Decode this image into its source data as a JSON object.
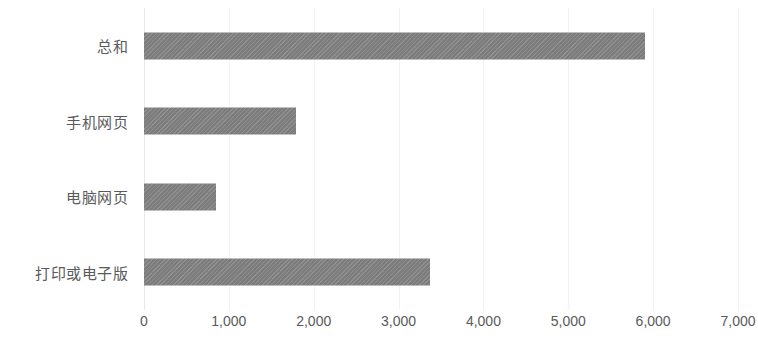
{
  "chart_data": {
    "type": "bar",
    "orientation": "horizontal",
    "title": "",
    "subtitle": "",
    "xlabel": "",
    "ylabel": "",
    "categories": [
      "总和",
      "手机网页",
      "电脑网页",
      "打印或电子版"
    ],
    "values": [
      5900,
      1790,
      850,
      3370
    ],
    "series": [
      {
        "name": "",
        "values": [
          5900,
          1790,
          850,
          3370
        ]
      }
    ],
    "xlim": [
      0,
      7000
    ],
    "xticks": [
      0,
      1000,
      2000,
      3000,
      4000,
      5000,
      6000,
      7000
    ],
    "xtick_labels": [
      "0",
      "1,000",
      "2,000",
      "3,000",
      "4,000",
      "5,000",
      "6,000",
      "7,000"
    ],
    "grid": true,
    "grid_axis": "x",
    "legend": false,
    "legend_position": "none",
    "annotations": [],
    "colors": {
      "bar": "#828282",
      "gridline": "#f2f2f2",
      "axis_text": "#5a5a5a",
      "background": "#ffffff"
    }
  },
  "axis": {
    "x_ticks": [
      {
        "value": 0,
        "label": "0"
      },
      {
        "value": 1000,
        "label": "1,000"
      },
      {
        "value": 2000,
        "label": "2,000"
      },
      {
        "value": 3000,
        "label": "3,000"
      },
      {
        "value": 4000,
        "label": "4,000"
      },
      {
        "value": 5000,
        "label": "5,000"
      },
      {
        "value": 6000,
        "label": "6,000"
      },
      {
        "value": 7000,
        "label": "7,000"
      }
    ]
  },
  "categories": [
    {
      "label": "总和",
      "value": 5900
    },
    {
      "label": "手机网页",
      "value": 1790
    },
    {
      "label": "电脑网页",
      "value": 850
    },
    {
      "label": "打印或电子版",
      "value": 3370
    }
  ]
}
